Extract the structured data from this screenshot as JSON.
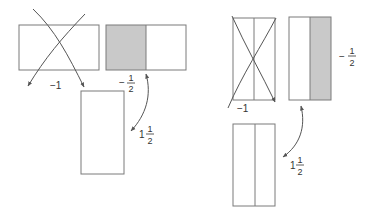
{
  "colors": {
    "stroke": "#7a7a7a",
    "shade": "#c9c9c9",
    "text": "#333333",
    "background": "#ffffff"
  },
  "left_panel": {
    "crossed_rect_label": "−1",
    "shaded_rect_label": {
      "sign": "−",
      "numerator": "1",
      "denominator": "2"
    },
    "result_rect_label": {
      "whole": "1",
      "numerator": "1",
      "denominator": "2"
    }
  },
  "right_panel": {
    "crossed_rect_label": "−1",
    "shaded_rect_label": {
      "sign": "−",
      "numerator": "1",
      "denominator": "2"
    },
    "result_rect_label": {
      "whole": "1",
      "numerator": "1",
      "denominator": "2"
    }
  }
}
